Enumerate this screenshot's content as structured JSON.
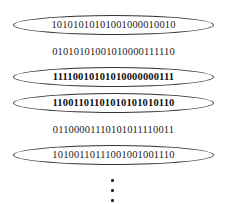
{
  "diagram": {
    "rows": [
      {
        "bits": "10101010101001000010010",
        "circled": true,
        "bold": false
      },
      {
        "bits": "01010101001010000111110",
        "circled": false,
        "bold": false
      },
      {
        "bits": "11110010101010000000111",
        "circled": true,
        "bold": true
      },
      {
        "bits": "11001101101010101010110",
        "circled": true,
        "bold": true
      },
      {
        "bits": "01100001110101011110011",
        "circled": false,
        "bold": false
      },
      {
        "bits": "10100110111001001001110",
        "circled": true,
        "bold": false
      }
    ],
    "continuation": "vertical ellipsis (more rows)"
  }
}
